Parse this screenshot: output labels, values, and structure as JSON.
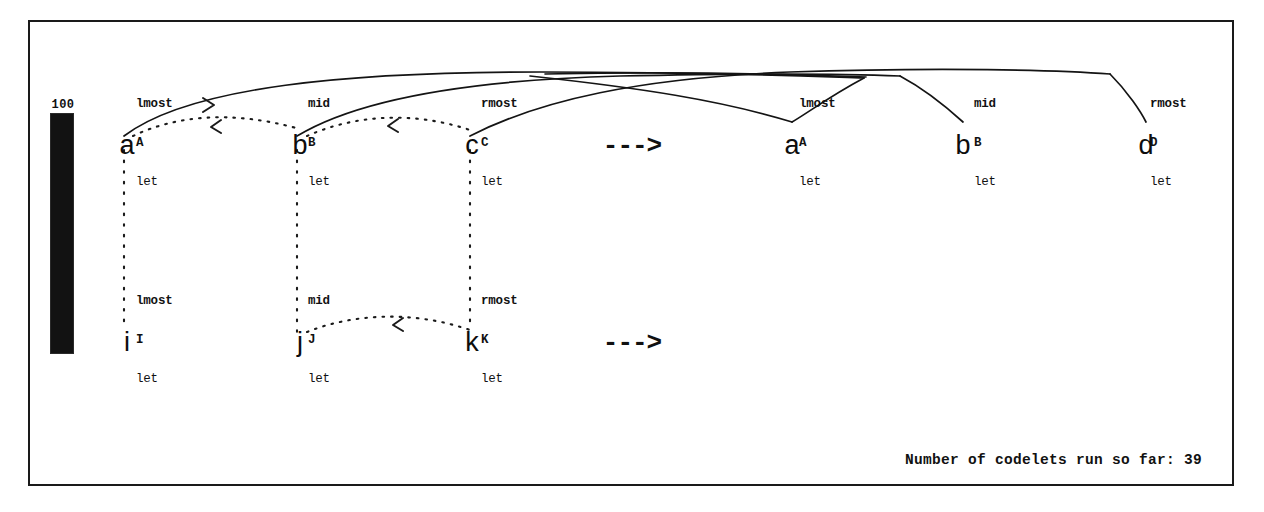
{
  "window": {
    "title": "Copycat Workspace"
  },
  "temperature": {
    "label": "100",
    "value": 100,
    "max": 100
  },
  "workspace": {
    "initial_string": {
      "name": "initial-string",
      "letters": [
        {
          "char": "a",
          "x": 127,
          "y": 132,
          "descriptors": {
            "position": "lmost",
            "category": "A",
            "object": "let"
          },
          "desc_x": 136,
          "desc_y": 72
        },
        {
          "char": "b",
          "x": 300,
          "y": 132,
          "descriptors": {
            "position": "mid",
            "category": "B",
            "object": "let"
          },
          "desc_x": 308,
          "desc_y": 72
        },
        {
          "char": "c",
          "x": 472,
          "y": 132,
          "descriptors": {
            "position": "rmost",
            "category": "C",
            "object": "let"
          },
          "desc_x": 481,
          "desc_y": 72
        }
      ]
    },
    "modified_string": {
      "name": "modified-string",
      "letters": [
        {
          "char": "a",
          "x": 792,
          "y": 132,
          "descriptors": {
            "position": "lmost",
            "category": "A",
            "object": "let"
          },
          "desc_x": 799,
          "desc_y": 72
        },
        {
          "char": "b",
          "x": 963,
          "y": 132,
          "descriptors": {
            "position": "mid",
            "category": "B",
            "object": "let"
          },
          "desc_x": 974,
          "desc_y": 72
        },
        {
          "char": "d",
          "x": 1146,
          "y": 132,
          "descriptors": {
            "position": "rmost",
            "category": "D",
            "object": "let"
          },
          "desc_x": 1150,
          "desc_y": 72
        }
      ]
    },
    "target_string": {
      "name": "target-string",
      "letters": [
        {
          "char": "i",
          "x": 127,
          "y": 329,
          "descriptors": {
            "position": "lmost",
            "category": "I",
            "object": "let"
          },
          "desc_x": 136,
          "desc_y": 269
        },
        {
          "char": "j",
          "x": 300,
          "y": 329,
          "descriptors": {
            "position": "mid",
            "category": "J",
            "object": "let"
          },
          "desc_x": 308,
          "desc_y": 269
        },
        {
          "char": "k",
          "x": 472,
          "y": 329,
          "descriptors": {
            "position": "rmost",
            "category": "K",
            "object": "let"
          },
          "desc_x": 481,
          "desc_y": 269
        }
      ]
    },
    "rule_arrow": {
      "label": "--->",
      "x": 632,
      "y": 133
    },
    "translated_rule_arrow": {
      "label": "--->",
      "x": 632,
      "y": 330
    }
  },
  "status": {
    "codelets_label": "Number of codelets run so far: 39"
  },
  "colors": {
    "ink": "#111111",
    "frame": "#1a1a1a",
    "thermometer_fill": "#121212",
    "background": "#ffffff"
  }
}
